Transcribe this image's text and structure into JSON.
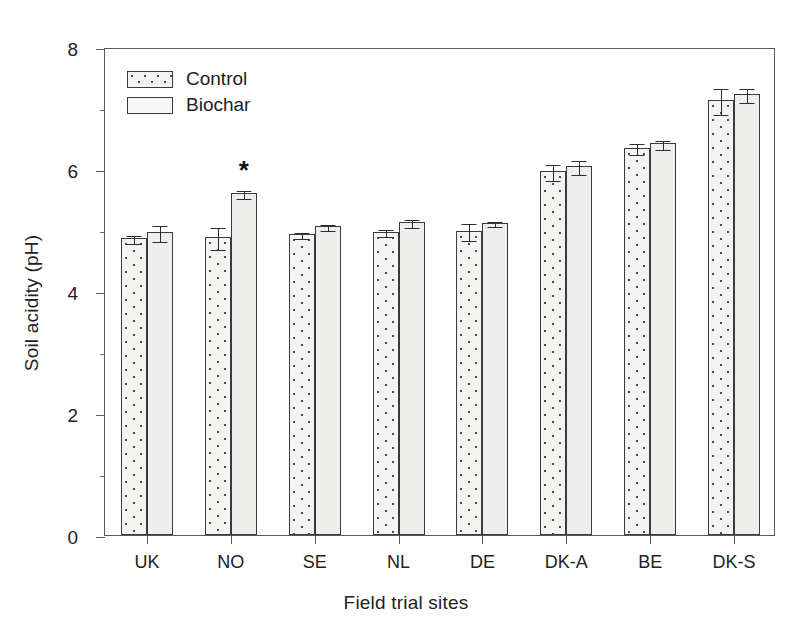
{
  "chart_data": {
    "type": "bar",
    "title": "",
    "xlabel": "Field trial sites",
    "ylabel": "Soil acidity (pH)",
    "categories": [
      "UK",
      "NO",
      "SE",
      "NL",
      "DE",
      "DK-A",
      "BE",
      "DK-S"
    ],
    "ylim": [
      0,
      8
    ],
    "yticks": [
      0,
      2,
      4,
      6,
      8
    ],
    "ytick_labels": [
      "0",
      "2",
      "4",
      "6",
      "8"
    ],
    "minor_yticks": [
      1,
      3,
      5,
      7
    ],
    "grid": false,
    "legend_position": "upper-left-inside",
    "series": [
      {
        "name": "Control",
        "fill": "dotted-stipple",
        "values": [
          4.87,
          4.88,
          4.93,
          4.97,
          4.99,
          5.97,
          6.35,
          7.13
        ],
        "errors": [
          0.06,
          0.18,
          0.05,
          0.06,
          0.14,
          0.13,
          0.09,
          0.22
        ]
      },
      {
        "name": "Biochar",
        "fill": "plain-light",
        "values": [
          4.97,
          5.61,
          5.06,
          5.13,
          5.12,
          6.05,
          6.42,
          7.23
        ],
        "errors": [
          0.13,
          0.07,
          0.05,
          0.06,
          0.04,
          0.12,
          0.07,
          0.12
        ]
      }
    ],
    "annotations": [
      {
        "text": "*",
        "category": "NO",
        "series": "Biochar",
        "meaning": "significant-difference"
      }
    ]
  },
  "legend": {
    "items": [
      {
        "label": "Control",
        "swatch": "dotted-swatch"
      },
      {
        "label": "Biochar",
        "swatch": "plain-swatch"
      }
    ]
  },
  "axes": {
    "y_title": "Soil acidity (pH)",
    "x_title": "Field trial sites"
  },
  "colors": {
    "bar_outline": "#3a3a3c",
    "control_fill": "#f4f4f2",
    "biochar_fill": "#eeeeec",
    "axis": "#58585a",
    "text": "#222222",
    "error_bar": "#2b2b2d"
  }
}
